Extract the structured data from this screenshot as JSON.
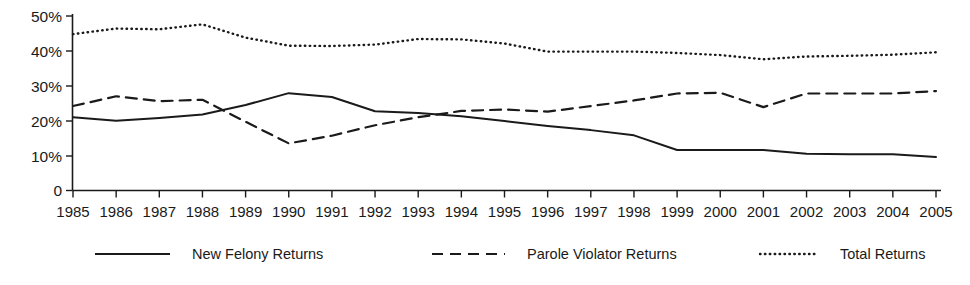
{
  "chart_data": {
    "type": "line",
    "title": "",
    "subtitle": "",
    "xlabel": "",
    "ylabel": "",
    "grid": false,
    "legend_position": "bottom",
    "ylim": [
      0,
      50
    ],
    "ytick_labels": [
      "50%",
      "40%",
      "30%",
      "20%",
      "10%",
      "0"
    ],
    "ytick_values": [
      50,
      40,
      30,
      20,
      10,
      0
    ],
    "categories": [
      "1985",
      "1986",
      "1987",
      "1988",
      "1989",
      "1990",
      "1991",
      "1992",
      "1993",
      "1994",
      "1995",
      "1996",
      "1997",
      "1998",
      "1999",
      "2000",
      "2001",
      "2002",
      "2003",
      "2004",
      "2005"
    ],
    "x": [
      1985,
      1986,
      1987,
      1988,
      1989,
      1990,
      1991,
      1992,
      1993,
      1994,
      1995,
      1996,
      1997,
      1998,
      1999,
      2000,
      2001,
      2002,
      2003,
      2004,
      2005
    ],
    "series": [
      {
        "name": "New Felony Returns",
        "style": "solid",
        "values": [
          21.0,
          20.0,
          20.8,
          21.8,
          24.5,
          27.9,
          26.8,
          22.7,
          22.2,
          21.3,
          19.9,
          18.5,
          17.3,
          15.8,
          11.6,
          11.6,
          11.6,
          10.5,
          10.4,
          10.4,
          9.6
        ]
      },
      {
        "name": "Parole Violator Returns",
        "style": "dashed",
        "values": [
          24.2,
          27.0,
          25.6,
          26.0,
          19.7,
          13.5,
          15.7,
          18.7,
          21.0,
          22.8,
          23.2,
          22.6,
          24.2,
          25.8,
          27.8,
          28.0,
          23.9,
          27.8,
          27.8,
          27.8,
          28.5
        ]
      },
      {
        "name": "Total Returns",
        "style": "dotted",
        "values": [
          44.8,
          46.4,
          46.2,
          47.6,
          43.8,
          41.5,
          41.4,
          41.8,
          43.4,
          43.3,
          42.1,
          39.8,
          39.8,
          39.8,
          39.4,
          38.8,
          37.6,
          38.4,
          38.6,
          38.9,
          39.6
        ]
      }
    ]
  },
  "legend": {
    "items": [
      {
        "label": "New Felony Returns",
        "style": "solid"
      },
      {
        "label": "Parole Violator Returns",
        "style": "dashed"
      },
      {
        "label": "Total Returns",
        "style": "dotted"
      }
    ]
  }
}
